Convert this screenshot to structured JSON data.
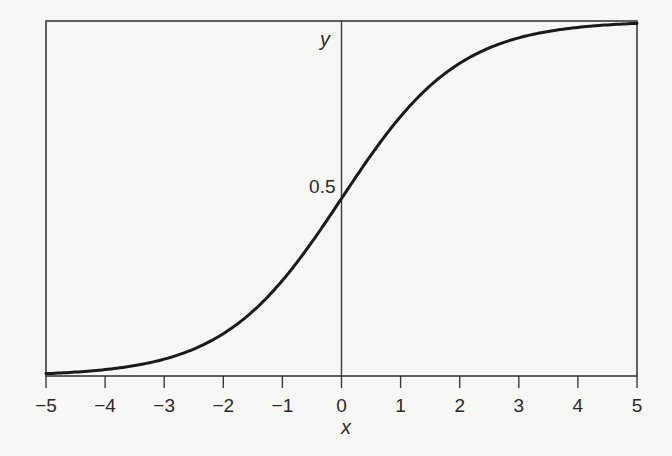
{
  "chart_data": {
    "type": "line",
    "title": "",
    "xlabel": "x",
    "ylabel": "y",
    "xlim": [
      -5,
      5
    ],
    "ylim": [
      0,
      1
    ],
    "grid": false,
    "legend": null,
    "x_ticks": [
      -5,
      -4,
      -3,
      -2,
      -1,
      0,
      1,
      2,
      3,
      4,
      5
    ],
    "x_tick_labels": [
      "−5",
      "−4",
      "−3",
      "−2",
      "−1",
      "0",
      "1",
      "2",
      "3",
      "4",
      "5"
    ],
    "y_tick_labels": [
      {
        "value": 0.5,
        "label": "0.5"
      }
    ],
    "function": "y = 1 / (1 + e^(-x))",
    "series": [
      {
        "name": "logistic sigmoid",
        "x": [
          -5,
          -4,
          -3,
          -2,
          -1,
          0,
          1,
          2,
          3,
          4,
          5
        ],
        "values": [
          0.007,
          0.018,
          0.047,
          0.119,
          0.269,
          0.5,
          0.731,
          0.881,
          0.953,
          0.982,
          0.993
        ],
        "color": "#1a1a1a"
      }
    ]
  },
  "colors": {
    "background": "#f7f7f5",
    "frame": "#3a3a3a",
    "curve": "#1a1a1a",
    "text": "#2a2a2a"
  }
}
